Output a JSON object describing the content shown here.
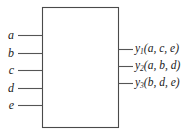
{
  "figure": {
    "type": "black-box-logic-diagram",
    "block": {
      "fill": "#ffffff",
      "stroke": "#4a4a4a",
      "x": 42,
      "y": 7,
      "width": 76,
      "height": 121,
      "label": ""
    },
    "colors": {
      "line": "#555555",
      "text": "#1a1a1a",
      "background": "#ffffff"
    },
    "inputs": [
      {
        "name": "a",
        "label": "a",
        "y": 35
      },
      {
        "name": "b",
        "label": "b",
        "y": 53
      },
      {
        "name": "c",
        "label": "c",
        "y": 70
      },
      {
        "name": "d",
        "label": "d",
        "y": 88
      },
      {
        "name": "e",
        "label": "e",
        "y": 105
      }
    ],
    "outputs": [
      {
        "name": "y1",
        "base": "y",
        "subscript": "1",
        "args": "(a, c, e)",
        "y": 49
      },
      {
        "name": "y2",
        "base": "y",
        "subscript": "2",
        "args": "(a, b, d)",
        "y": 66
      },
      {
        "name": "y3",
        "base": "y",
        "subscript": "3",
        "args": "(b, d, e)",
        "y": 83
      }
    ]
  }
}
